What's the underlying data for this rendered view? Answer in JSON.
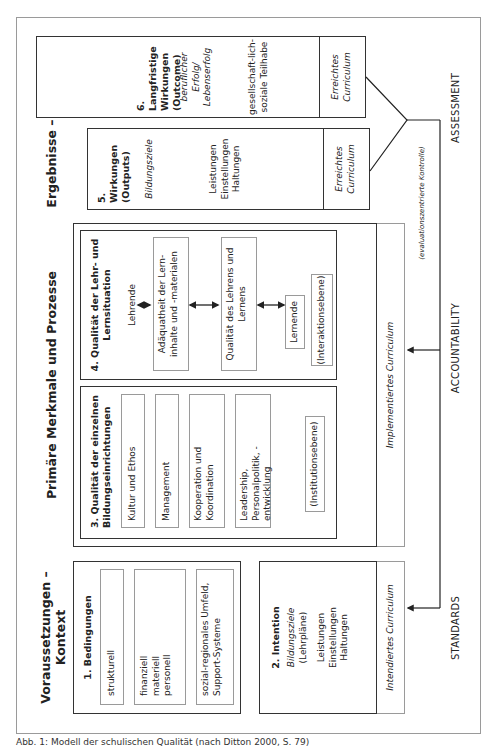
{
  "columns": {
    "context": "Voraussetzungen – Kontext",
    "processes": "Primäre Merkmale und Prozesse",
    "results": "Ergebnisse – Wirkungen"
  },
  "box1": {
    "title": "1. Bedingungen",
    "items": [
      "strukturell",
      "finanziell\nmateriell\npersonell",
      "sozial-regionales Umfeld, Support-Systeme"
    ]
  },
  "box2": {
    "title": "2. Intention",
    "goal": "Bildungsziele",
    "goal_sub": "(Lehrpläne)",
    "items": "Leistungen\nEinstellungen\nHaltungen",
    "curriculum": "Intendiertes Curriculum"
  },
  "box3": {
    "title": "3. Qualität der einzelnen Bildungseinrichtungen",
    "items": [
      "Kultur und Ethos",
      "Management",
      "Kooperation und Koordination",
      "Leadership, Personalpolitik, -entwicklung"
    ],
    "level": "(Institutionsebene)"
  },
  "box4": {
    "title": "4. Qualität der Lehr- und Lernsituation",
    "teacher": "Lehrende",
    "items": [
      "Adäquatheit der Lern-inhalte und -materialen",
      "Qualität des Lehrens und Lernens"
    ],
    "learner": "Lernende",
    "level": "(Interaktionsebene)"
  },
  "implemented_curriculum": "Implementiertes Curriculum",
  "box5": {
    "title": "5. Wirkungen (Outputs)",
    "goal": "Bildungsziele",
    "items": "Leistungen\nEinstellungen\nHaltungen",
    "curriculum": "Erreichtes Curriculum"
  },
  "box6": {
    "title": "6. Langfristige Wirkungen (Outcome)",
    "success": "beruflicher Erfolg/ Lebenserfolg",
    "participation": "gesellschaft-lich-soziale Teilhabe",
    "curriculum": "Erreichtes Curriculum"
  },
  "feedback": {
    "evaluation_note": "(evaluationszentrierte Kontrolle)",
    "standards": "STANDARDS",
    "accountability": "ACCOUNTABILITY",
    "assessment": "ASSESSMENT"
  },
  "caption": "Abb. 1: Modell der schulischen Qualität (nach Ditton 2000, S. 79)"
}
